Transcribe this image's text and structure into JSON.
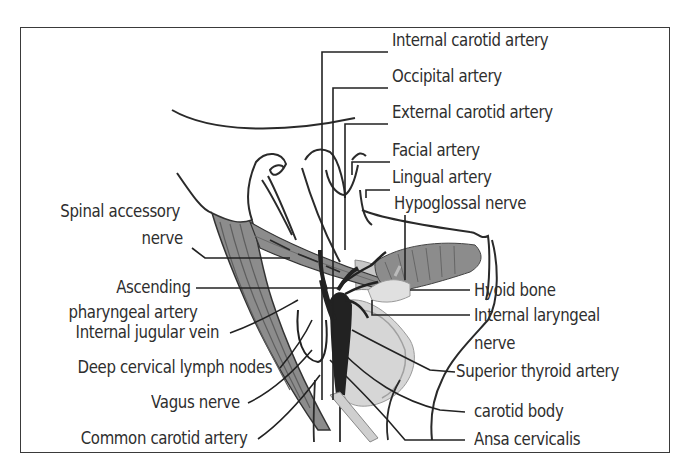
{
  "figure": {
    "colors": {
      "line": "#2a2a2a",
      "muscle": "#8c8c8c",
      "muscle_stripe": "#5e5e5e",
      "vessel": "#222222",
      "light_tissue": "#cfcfcf",
      "frame": "#3a3a3a"
    }
  },
  "labels": {
    "right": [
      {
        "id": "internal-carotid-artery",
        "text": "Internal carotid artery"
      },
      {
        "id": "occipital-artery",
        "text": "Occipital artery"
      },
      {
        "id": "external-carotid-artery",
        "text": "External carotid artery"
      },
      {
        "id": "facial-artery",
        "text": "Facial artery"
      },
      {
        "id": "lingual-artery",
        "text": "Lingual artery"
      },
      {
        "id": "hypoglossal-nerve",
        "text": "Hypoglossal nerve"
      },
      {
        "id": "hyoid-bone",
        "text": "Hyoid bone"
      },
      {
        "id": "internal-laryngeal-nerve-1",
        "text": "Internal laryngeal"
      },
      {
        "id": "internal-laryngeal-nerve-2",
        "text": "nerve"
      },
      {
        "id": "superior-thyroid-artery",
        "text": "Superior thyroid artery"
      },
      {
        "id": "carotid-body",
        "text": "carotid body"
      },
      {
        "id": "ansa-cervicalis",
        "text": "Ansa cervicalis"
      }
    ],
    "left": [
      {
        "id": "spinal-accessory-nerve-1",
        "text": "Spinal accessory"
      },
      {
        "id": "spinal-accessory-nerve-2",
        "text": "nerve"
      },
      {
        "id": "ascending-pharyngeal-artery-1",
        "text": "Ascending"
      },
      {
        "id": "ascending-pharyngeal-artery-2",
        "text": "pharyngeal artery"
      },
      {
        "id": "internal-jugular-vein",
        "text": "Internal jugular vein"
      },
      {
        "id": "deep-cervical-lymph-nodes",
        "text": "Deep cervical lymph nodes"
      },
      {
        "id": "vagus-nerve",
        "text": "Vagus nerve"
      },
      {
        "id": "common-carotid-artery",
        "text": "Common carotid artery"
      }
    ]
  }
}
